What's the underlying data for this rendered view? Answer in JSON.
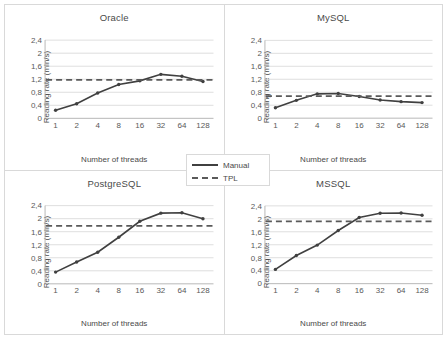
{
  "figure": {
    "legend": {
      "position": "center-between-rows",
      "entries": [
        {
          "label": "Manual",
          "style": "solid",
          "color": "#404040"
        },
        {
          "label": "TPL",
          "style": "dashed",
          "color": "#5a5a5a"
        }
      ]
    }
  },
  "chart_data": [
    {
      "type": "line",
      "title": "Oracle",
      "xlabel": "Number of threads",
      "ylabel": "Reading rate (mln/s)",
      "categories": [
        "1",
        "2",
        "4",
        "8",
        "16",
        "32",
        "64",
        "128"
      ],
      "yticks": [
        "0",
        "0,4",
        "0,8",
        "1,2",
        "1,6",
        "2",
        "2,4"
      ],
      "ylim": [
        0,
        2.4
      ],
      "grid": true,
      "series": [
        {
          "name": "Manual",
          "style": "solid",
          "markers": true,
          "values": [
            0.25,
            0.45,
            0.78,
            1.04,
            1.15,
            1.35,
            1.29,
            1.13
          ]
        },
        {
          "name": "TPL",
          "style": "dashed",
          "markers": false,
          "constant": 1.18
        }
      ]
    },
    {
      "type": "line",
      "title": "MySQL",
      "xlabel": "Number of threads",
      "ylabel": "Reading rate (mln/s)",
      "categories": [
        "1",
        "2",
        "4",
        "8",
        "16",
        "32",
        "64",
        "128"
      ],
      "yticks": [
        "0",
        "0,4",
        "0,8",
        "1,2",
        "1,6",
        "2",
        "2,4"
      ],
      "ylim": [
        0,
        2.4
      ],
      "grid": true,
      "series": [
        {
          "name": "Manual",
          "style": "solid",
          "markers": true,
          "values": [
            0.32,
            0.55,
            0.75,
            0.76,
            0.67,
            0.56,
            0.51,
            0.48
          ]
        },
        {
          "name": "TPL",
          "style": "dashed",
          "markers": false,
          "constant": 0.68
        }
      ]
    },
    {
      "type": "line",
      "title": "PostgreSQL",
      "xlabel": "Number of threads",
      "ylabel": "Reading rate (mln/s)",
      "categories": [
        "1",
        "2",
        "4",
        "8",
        "16",
        "32",
        "64",
        "128"
      ],
      "yticks": [
        "0",
        "0,4",
        "0,8",
        "1,2",
        "1,6",
        "2",
        "2,4"
      ],
      "ylim": [
        0,
        2.4
      ],
      "grid": true,
      "series": [
        {
          "name": "Manual",
          "style": "solid",
          "markers": true,
          "values": [
            0.36,
            0.67,
            0.97,
            1.43,
            1.92,
            2.17,
            2.18,
            2.0
          ]
        },
        {
          "name": "TPL",
          "style": "dashed",
          "markers": false,
          "constant": 1.78
        }
      ]
    },
    {
      "type": "line",
      "title": "MSSQL",
      "xlabel": "Number of threads",
      "ylabel": "Reading rate (mln/s)",
      "categories": [
        "1",
        "2",
        "4",
        "8",
        "16",
        "32",
        "64",
        "128"
      ],
      "yticks": [
        "0",
        "0,4",
        "0,8",
        "1,2",
        "1,6",
        "2",
        "2,4"
      ],
      "ylim": [
        0,
        2.4
      ],
      "grid": true,
      "series": [
        {
          "name": "Manual",
          "style": "solid",
          "markers": true,
          "values": [
            0.44,
            0.87,
            1.19,
            1.64,
            2.04,
            2.17,
            2.18,
            2.11
          ]
        },
        {
          "name": "TPL",
          "style": "dashed",
          "markers": false,
          "constant": 1.92
        }
      ]
    }
  ]
}
